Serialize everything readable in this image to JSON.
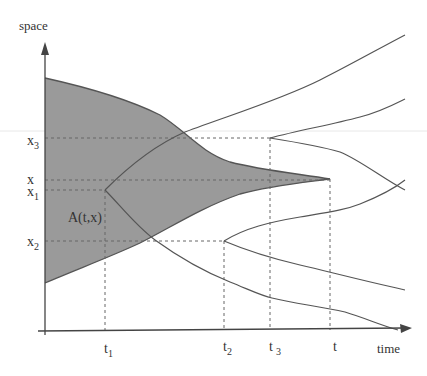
{
  "diagram": {
    "axes": {
      "y_label": "space",
      "x_label": "time"
    },
    "space_ticks": [
      {
        "id": "x3",
        "base": "x",
        "sub": "3",
        "y": 138
      },
      {
        "id": "x",
        "base": "x",
        "sub": "",
        "y": 180
      },
      {
        "id": "x1",
        "base": "x",
        "sub": "1",
        "y": 190
      },
      {
        "id": "x2",
        "base": "x",
        "sub": "2",
        "y": 241
      }
    ],
    "time_ticks": [
      {
        "id": "t1",
        "base": "t",
        "sub": "1",
        "x": 105
      },
      {
        "id": "t2",
        "base": "t",
        "sub": "2",
        "x": 224
      },
      {
        "id": "t3",
        "base": "t",
        "sub": "3",
        "x": 270
      },
      {
        "id": "t",
        "base": "t",
        "sub": "",
        "x": 330
      }
    ],
    "region_label": "A(t,x)",
    "colors": {
      "shaded_region": "#9a9a9a",
      "lines": "#555555",
      "axes": "#444444",
      "dashed": "#666666"
    }
  }
}
